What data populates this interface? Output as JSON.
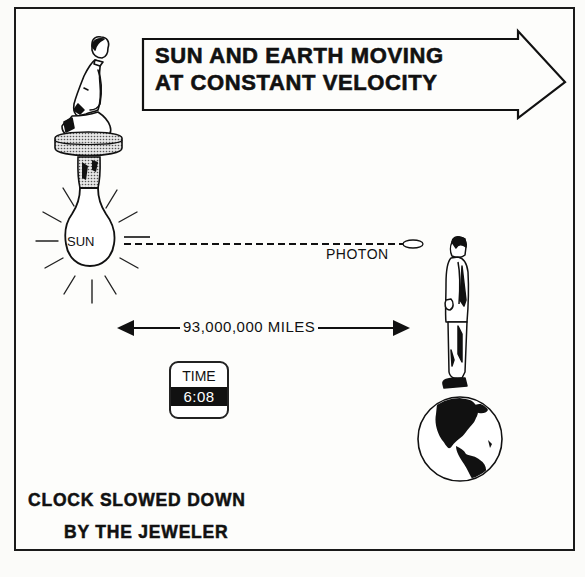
{
  "diagram": {
    "banner": {
      "line1": "SUN AND EARTH MOVING",
      "line2": "AT CONSTANT VELOCITY",
      "shape": "right-arrow"
    },
    "sun": {
      "label": "SUN",
      "depiction": "light-bulb-with-rays",
      "figure": "kneeling-person-on-socket"
    },
    "photon": {
      "label": "PHOTON",
      "path": "dashed-line"
    },
    "distance": {
      "label": "93,000,000 MILES",
      "arrow": "double-headed"
    },
    "clock": {
      "label": "TIME",
      "value": "6:08"
    },
    "earth": {
      "depiction": "globe-americas",
      "figure": "standing-man-on-globe"
    },
    "caption": {
      "line1": "CLOCK SLOWED DOWN",
      "line2": "BY THE JEWELER"
    },
    "colors": {
      "ink": "#111111",
      "paper": "#fdfdfb",
      "stipple": "#9a9a9a"
    }
  }
}
